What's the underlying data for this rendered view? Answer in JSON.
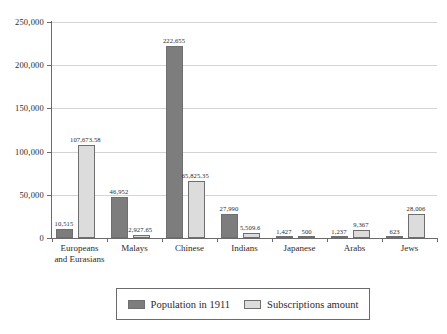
{
  "chart_data": {
    "type": "bar",
    "title": "",
    "subtitle": "",
    "xlabel": "",
    "ylabel": "",
    "ylim": [
      0,
      250000
    ],
    "grid": true,
    "legend_position": "bottom",
    "categories": [
      "Europeans and Eurasians",
      "Malays",
      "Chinese",
      "Indians",
      "Japanese",
      "Arabs",
      "Jews"
    ],
    "category_lines": [
      [
        "Europeans",
        "and Eurasians"
      ],
      [
        "Malays"
      ],
      [
        "Chinese"
      ],
      [
        "Indians"
      ],
      [
        "Japanese"
      ],
      [
        "Arabs"
      ],
      [
        "Jews"
      ]
    ],
    "ytick_values": [
      0,
      50000,
      100000,
      150000,
      200000,
      250000
    ],
    "ytick_labels": [
      "0",
      "50,000",
      "100,000",
      "150,000",
      "200,000",
      "250,000"
    ],
    "series": [
      {
        "name": "Population in 1911",
        "color": "#7d7d7d",
        "values": [
          10515,
          46952,
          222655,
          27990,
          1427,
          1237,
          623
        ],
        "labels": [
          "10,515",
          "46,952",
          "222,655",
          "27,990",
          "1,427",
          "1,237",
          "623"
        ]
      },
      {
        "name": "Subscriptions amount",
        "color": "#dcdcdc",
        "values": [
          107673.58,
          2927.65,
          65825.35,
          5509.6,
          500,
          9367,
          28006
        ],
        "labels": [
          "107,673.58",
          "2,927.65",
          "65,825.35",
          "5,509.6",
          "500",
          "9,367",
          "28,006"
        ]
      }
    ]
  },
  "legend": {
    "items": [
      {
        "label": "Population in 1911",
        "color": "#7d7d7d"
      },
      {
        "label": "Subscriptions amount",
        "color": "#dcdcdc"
      }
    ]
  },
  "colors": {
    "population_bar": "#7d7d7d",
    "subscriptions_bar": "#dcdcdc",
    "axis": "#6a6a6a",
    "gridline": "#d4d4d4",
    "text": "#2b2b2b",
    "background": "#ffffff"
  }
}
